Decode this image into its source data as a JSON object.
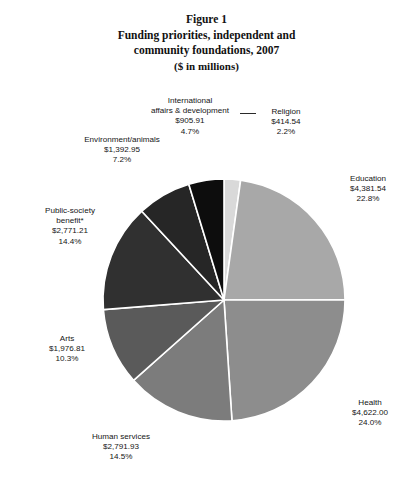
{
  "title": {
    "line1": "Figure 1",
    "line2": "Funding priorities, independent and",
    "line3": "community foundations, 2007",
    "line4": "($ in millions)"
  },
  "chart_data": {
    "type": "pie",
    "title": "Figure 1 Funding priorities, independent and community foundations, 2007 ($ in millions)",
    "units": "$ in millions",
    "legend_position": "none-labels-outside",
    "grid": false,
    "start_angle_deg": 0,
    "direction": "clockwise",
    "categories": [
      "Religion",
      "Education",
      "Health",
      "Human services",
      "Arts",
      "Public-society benefit*",
      "Environment/animals",
      "International affairs & development"
    ],
    "values": [
      414.54,
      4381.54,
      4622.0,
      2791.93,
      1976.81,
      2771.21,
      1392.95,
      905.91
    ],
    "percents": [
      2.2,
      22.8,
      24.0,
      14.5,
      10.3,
      14.4,
      7.2,
      4.7
    ],
    "value_labels": [
      "$414.54",
      "$4,381.54",
      "$4,622.00",
      "$2,791.93",
      "$1,976.81",
      "$2,771.21",
      "$1,392.95",
      "$905.91"
    ],
    "percent_labels": [
      "2.2%",
      "22.8%",
      "24.0%",
      "14.5%",
      "10.3%",
      "14.4%",
      "7.2%",
      "4.7%"
    ],
    "colors": [
      "#d9d9d9",
      "#a8a8a8",
      "#8d8d8d",
      "#7c7c7c",
      "#5a5a5a",
      "#303030",
      "#262626",
      "#0d0d0d"
    ],
    "slice_border_color": "#ffffff",
    "slices": [
      {
        "name": "Religion",
        "value": 414.54,
        "percent": 2.2,
        "value_label": "$414.54",
        "percent_label": "2.2%",
        "color": "#d9d9d9"
      },
      {
        "name": "Education",
        "value": 4381.54,
        "percent": 22.8,
        "value_label": "$4,381.54",
        "percent_label": "22.8%",
        "color": "#a8a8a8"
      },
      {
        "name": "Health",
        "value": 4622.0,
        "percent": 24.0,
        "value_label": "$4,622.00",
        "percent_label": "24.0%",
        "color": "#8d8d8d"
      },
      {
        "name": "Human services",
        "value": 2791.93,
        "percent": 14.5,
        "value_label": "$2,791.93",
        "percent_label": "14.5%",
        "color": "#7c7c7c"
      },
      {
        "name": "Arts",
        "value": 1976.81,
        "percent": 10.3,
        "value_label": "$1,976.81",
        "percent_label": "10.3%",
        "color": "#5a5a5a"
      },
      {
        "name": "Public-society benefit*",
        "value": 2771.21,
        "percent": 14.4,
        "value_label": "$2,771.21",
        "percent_label": "14.4%",
        "color": "#303030"
      },
      {
        "name": "Environment/animals",
        "value": 1392.95,
        "percent": 7.2,
        "value_label": "$1,392.95",
        "percent_label": "7.2%",
        "color": "#262626"
      },
      {
        "name": "International affairs & development",
        "value": 905.91,
        "percent": 4.7,
        "value_label": "$905.91",
        "percent_label": "4.7%",
        "color": "#0d0d0d"
      }
    ]
  },
  "labels": {
    "international": {
      "name_line1": "International",
      "name_line2": "affairs & development",
      "value": "$905.91",
      "percent": "4.7%"
    },
    "religion": {
      "name": "Religion",
      "value": "$414.54",
      "percent": "2.2%"
    },
    "environment": {
      "name": "Environment/animals",
      "value": "$1,392.95",
      "percent": "7.2%"
    },
    "public": {
      "name_line1": "Public-society",
      "name_line2": "benefit*",
      "value": "$2,771.21",
      "percent": "14.4%"
    },
    "arts": {
      "name": "Arts",
      "value": "$1,976.81",
      "percent": "10.3%"
    },
    "human": {
      "name": "Human services",
      "value": "$2,791.93",
      "percent": "14.5%"
    },
    "education": {
      "name": "Education",
      "value": "$4,381.54",
      "percent": "22.8%"
    },
    "health": {
      "name": "Health",
      "value": "$4,622.00",
      "percent": "24.0%"
    }
  }
}
